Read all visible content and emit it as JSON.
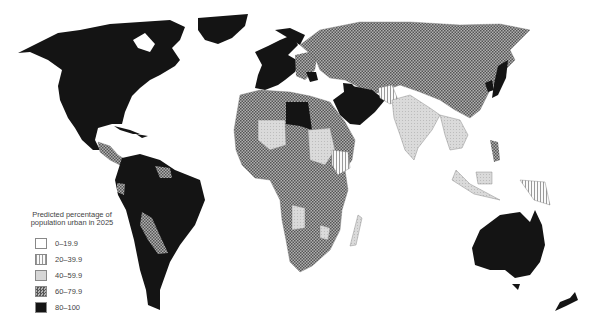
{
  "map": {
    "type": "choropleth",
    "projection": "world, equirectangular-like",
    "colors": {
      "background": "#ffffff",
      "c0_19": "#ffffff",
      "c20_39": "#f2f2f2",
      "c40_59": "#d4d4d4",
      "c60_79": "#8a8a8a",
      "c80_100": "#141414",
      "border": "#777777"
    },
    "legend": {
      "title_line1": "Predicted percentage of",
      "title_line2": "population urban in 2025",
      "items": [
        {
          "label": "0–19.9",
          "pattern": "blank"
        },
        {
          "label": "20–39.9",
          "pattern": "vertical-stripes"
        },
        {
          "label": "40–59.9",
          "pattern": "light-stipple"
        },
        {
          "label": "60–79.9",
          "pattern": "crosshatch"
        },
        {
          "label": "80–100",
          "pattern": "solid-black"
        }
      ]
    },
    "regions": [
      {
        "name": "North America (USA, Canada, Mexico)",
        "class": "80–100"
      },
      {
        "name": "Greenland",
        "class": "80–100"
      },
      {
        "name": "Central America",
        "class": "60–79.9"
      },
      {
        "name": "Caribbean",
        "class": "60–79.9"
      },
      {
        "name": "South America (most)",
        "class": "80–100"
      },
      {
        "name": "Bolivia",
        "class": "60–79.9"
      },
      {
        "name": "Guyana/Suriname",
        "class": "60–79.9"
      },
      {
        "name": "Ecuador",
        "class": "60–79.9"
      },
      {
        "name": "Western Europe",
        "class": "80–100"
      },
      {
        "name": "Eastern Europe",
        "class": "60–79.9"
      },
      {
        "name": "Russia / Central Asia",
        "class": "60–79.9"
      },
      {
        "name": "China",
        "class": "60–79.9"
      },
      {
        "name": "Japan",
        "class": "80–100"
      },
      {
        "name": "South Korea",
        "class": "80–100"
      },
      {
        "name": "Libya",
        "class": "80–100"
      },
      {
        "name": "Saudi Arabia / Middle East",
        "class": "80–100"
      },
      {
        "name": "Egypt",
        "class": "60–79.9"
      },
      {
        "name": "Afghanistan",
        "class": "20–39.9"
      },
      {
        "name": "India / South Asia",
        "class": "40–59.9"
      },
      {
        "name": "Southeast Asia",
        "class": "40–59.9"
      },
      {
        "name": "Sahel states",
        "class": "40–59.9"
      },
      {
        "name": "Ethiopia",
        "class": "20–39.9"
      },
      {
        "name": "Central & Southern Africa",
        "class": "60–79.9"
      },
      {
        "name": "Madagascar",
        "class": "40–59.9"
      },
      {
        "name": "Papua New Guinea",
        "class": "20–39.9"
      },
      {
        "name": "Australia",
        "class": "80–100"
      },
      {
        "name": "New Zealand",
        "class": "80–100"
      }
    ]
  }
}
